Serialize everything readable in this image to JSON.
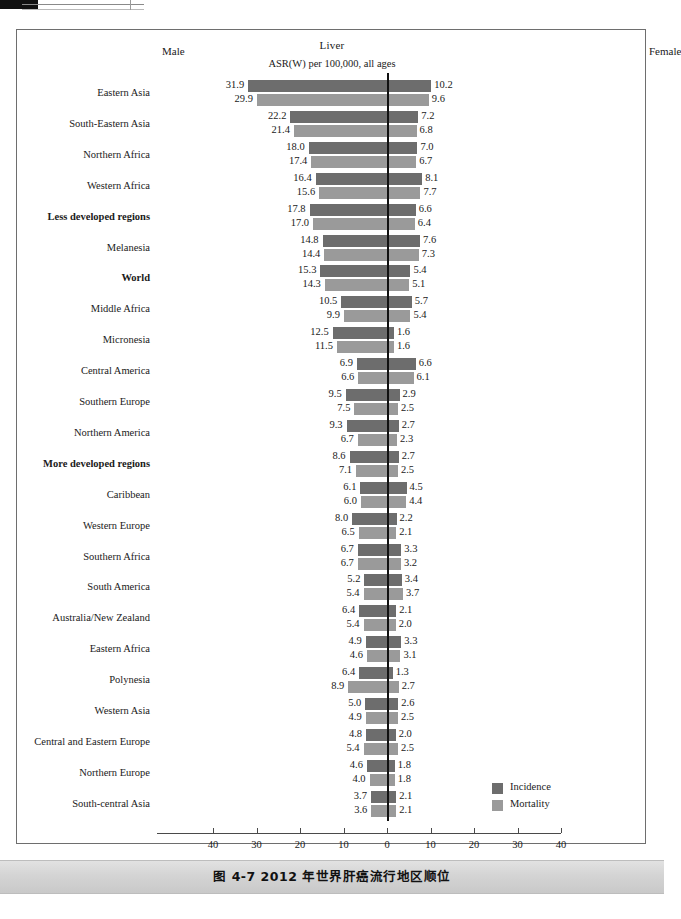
{
  "page": {
    "caption": "图 4-7    2012 年世界肝癌流行地区顺位"
  },
  "figure": {
    "title": "Liver",
    "subtitle": "ASR(W) per 100,000, all ages",
    "male_label": "Male",
    "female_label": "Female",
    "legend": [
      {
        "key": "incidence",
        "label": "Incidence",
        "color": "#6d6d6d"
      },
      {
        "key": "mortality",
        "label": "Mortality",
        "color": "#9a9a9a"
      }
    ]
  },
  "chart_data": {
    "type": "bar",
    "orientation": "horizontal-diverging",
    "title": "Liver",
    "subtitle": "ASR(W) per 100,000, all ages",
    "xlabel": "",
    "ylabel": "",
    "left_side": "Male",
    "right_side": "Female",
    "xlim": [
      -40,
      40
    ],
    "xticks": [
      40,
      30,
      20,
      10,
      0,
      10,
      20,
      30,
      40
    ],
    "grid": false,
    "legend": [
      "Incidence",
      "Mortality"
    ],
    "legend_position": "bottom-right",
    "series": [
      {
        "name": "Incidence",
        "color": "#6d6d6d"
      },
      {
        "name": "Mortality",
        "color": "#9a9a9a"
      }
    ],
    "categories": [
      "Eastern Asia",
      "South-Eastern Asia",
      "Northern Africa",
      "Western Africa",
      "Less developed regions",
      "Melanesia",
      "World",
      "Middle Africa",
      "Micronesia",
      "Central America",
      "Southern Europe",
      "Northern America",
      "More developed regions",
      "Caribbean",
      "Western Europe",
      "Southern Africa",
      "South America",
      "Australia/New Zealand",
      "Eastern Africa",
      "Polynesia",
      "Western Asia",
      "Central and Eastern Europe",
      "Northern Europe",
      "South-central Asia"
    ],
    "rows": [
      {
        "region": "Eastern Asia",
        "bold": false,
        "male_incidence": 31.9,
        "male_mortality": 29.9,
        "female_incidence": 10.2,
        "female_mortality": 9.6
      },
      {
        "region": "South-Eastern Asia",
        "bold": false,
        "male_incidence": 22.2,
        "male_mortality": 21.4,
        "female_incidence": 7.2,
        "female_mortality": 6.8
      },
      {
        "region": "Northern Africa",
        "bold": false,
        "male_incidence": 18.0,
        "male_mortality": 17.4,
        "female_incidence": 7.0,
        "female_mortality": 6.7
      },
      {
        "region": "Western Africa",
        "bold": false,
        "male_incidence": 16.4,
        "male_mortality": 15.6,
        "female_incidence": 8.1,
        "female_mortality": 7.7
      },
      {
        "region": "Less developed regions",
        "bold": true,
        "male_incidence": 17.8,
        "male_mortality": 17.0,
        "female_incidence": 6.6,
        "female_mortality": 6.4
      },
      {
        "region": "Melanesia",
        "bold": false,
        "male_incidence": 14.8,
        "male_mortality": 14.4,
        "female_incidence": 7.6,
        "female_mortality": 7.3
      },
      {
        "region": "World",
        "bold": true,
        "male_incidence": 15.3,
        "male_mortality": 14.3,
        "female_incidence": 5.4,
        "female_mortality": 5.1
      },
      {
        "region": "Middle Africa",
        "bold": false,
        "male_incidence": 10.5,
        "male_mortality": 9.9,
        "female_incidence": 5.7,
        "female_mortality": 5.4
      },
      {
        "region": "Micronesia",
        "bold": false,
        "male_incidence": 12.5,
        "male_mortality": 11.5,
        "female_incidence": 1.6,
        "female_mortality": 1.6
      },
      {
        "region": "Central America",
        "bold": false,
        "male_incidence": 6.9,
        "male_mortality": 6.6,
        "female_incidence": 6.6,
        "female_mortality": 6.1
      },
      {
        "region": "Southern Europe",
        "bold": false,
        "male_incidence": 9.5,
        "male_mortality": 7.5,
        "female_incidence": 2.9,
        "female_mortality": 2.5
      },
      {
        "region": "Northern America",
        "bold": false,
        "male_incidence": 9.3,
        "male_mortality": 6.7,
        "female_incidence": 2.7,
        "female_mortality": 2.3
      },
      {
        "region": "More developed regions",
        "bold": true,
        "male_incidence": 8.6,
        "male_mortality": 7.1,
        "female_incidence": 2.7,
        "female_mortality": 2.5
      },
      {
        "region": "Caribbean",
        "bold": false,
        "male_incidence": 6.1,
        "male_mortality": 6.0,
        "female_incidence": 4.5,
        "female_mortality": 4.4
      },
      {
        "region": "Western Europe",
        "bold": false,
        "male_incidence": 8.0,
        "male_mortality": 6.5,
        "female_incidence": 2.2,
        "female_mortality": 2.1
      },
      {
        "region": "Southern Africa",
        "bold": false,
        "male_incidence": 6.7,
        "male_mortality": 6.7,
        "female_incidence": 3.3,
        "female_mortality": 3.2
      },
      {
        "region": "South America",
        "bold": false,
        "male_incidence": 5.2,
        "male_mortality": 5.4,
        "female_incidence": 3.4,
        "female_mortality": 3.7
      },
      {
        "region": "Australia/New Zealand",
        "bold": false,
        "male_incidence": 6.4,
        "male_mortality": 5.4,
        "female_incidence": 2.1,
        "female_mortality": 2.0
      },
      {
        "region": "Eastern Africa",
        "bold": false,
        "male_incidence": 4.9,
        "male_mortality": 4.6,
        "female_incidence": 3.3,
        "female_mortality": 3.1
      },
      {
        "region": "Polynesia",
        "bold": false,
        "male_incidence": 6.4,
        "male_mortality": 8.9,
        "female_incidence": 1.3,
        "female_mortality": 2.7
      },
      {
        "region": "Western Asia",
        "bold": false,
        "male_incidence": 5.0,
        "male_mortality": 4.9,
        "female_incidence": 2.6,
        "female_mortality": 2.5
      },
      {
        "region": "Central and Eastern Europe",
        "bold": false,
        "male_incidence": 4.8,
        "male_mortality": 5.4,
        "female_incidence": 2.0,
        "female_mortality": 2.5
      },
      {
        "region": "Northern Europe",
        "bold": false,
        "male_incidence": 4.6,
        "male_mortality": 4.0,
        "female_incidence": 1.8,
        "female_mortality": 1.8
      },
      {
        "region": "South-central Asia",
        "bold": false,
        "male_incidence": 3.7,
        "male_mortality": 3.6,
        "female_incidence": 2.1,
        "female_mortality": 2.1
      }
    ]
  },
  "geometry": {
    "zero_x": 387,
    "px_per_unit": 4.35,
    "row_top": 79,
    "row_height": 30.9,
    "axis_y": 833,
    "axis_left_x": 157,
    "axis_right_x": 561
  }
}
